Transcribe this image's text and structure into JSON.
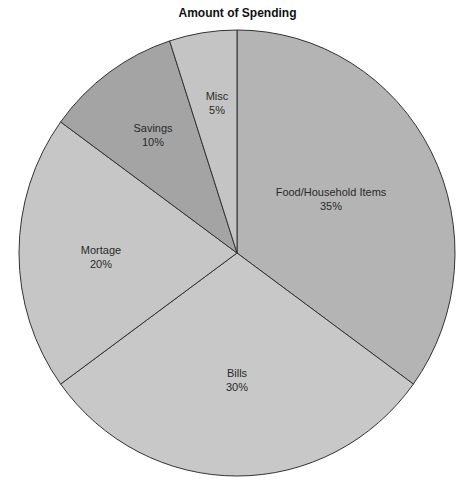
{
  "chart_data": {
    "type": "pie",
    "title": "Amount of Spending",
    "start_angle_deg": 0,
    "direction": "clockwise",
    "slices": [
      {
        "label": "Food/Household Items",
        "value": 35,
        "display": "35%",
        "color": "#b4b4b4",
        "label_pos": [
          331,
          196
        ]
      },
      {
        "label": "Bills",
        "value": 30,
        "display": "30%",
        "color": "#c8c8c8",
        "label_pos": [
          237,
          377
        ]
      },
      {
        "label": "Mortage",
        "value": 20,
        "display": "20%",
        "color": "#c6c6c6",
        "label_pos": [
          101,
          254
        ]
      },
      {
        "label": "Savings",
        "value": 10,
        "display": "10%",
        "color": "#a4a4a4",
        "label_pos": [
          153,
          132
        ]
      },
      {
        "label": "Misc",
        "value": 5,
        "display": "5%",
        "color": "#c4c4c4",
        "label_pos": [
          217,
          100
        ]
      }
    ]
  }
}
